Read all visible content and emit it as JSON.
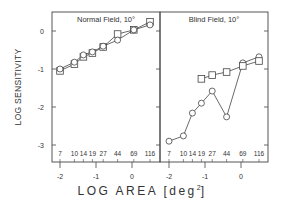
{
  "chart_data": [
    {
      "type": "line",
      "title": "Normal Field, 10°",
      "xlabel": "LOG AREA [deg²]",
      "ylabel": "LOG SENSITIVITY",
      "xlim": [
        -2.2,
        0.75
      ],
      "ylim": [
        -3.4,
        0.5
      ],
      "xticks": [
        -2,
        -1,
        0
      ],
      "yticks": [
        0,
        -1,
        -2,
        -3
      ],
      "area_labels": [
        "7",
        "10",
        "14",
        "19",
        "27",
        "44",
        "69",
        "116"
      ],
      "x": [
        -2.0,
        -1.6,
        -1.35,
        -1.1,
        -0.8,
        -0.4,
        0.05,
        0.5
      ],
      "series": [
        {
          "name": "squares",
          "marker": "square",
          "values": [
            -1.05,
            -0.87,
            -0.68,
            -0.58,
            -0.42,
            -0.08,
            0.03,
            0.24
          ]
        },
        {
          "name": "circles",
          "marker": "circle",
          "values": [
            -1.0,
            -0.82,
            -0.63,
            -0.55,
            -0.4,
            -0.24,
            0.03,
            0.16
          ]
        }
      ],
      "grid": false
    },
    {
      "type": "line",
      "title": "Blind Field, 10°",
      "xlabel": "LOG AREA [deg²]",
      "ylabel": "LOG SENSITIVITY",
      "xlim": [
        -2.2,
        0.75
      ],
      "ylim": [
        -3.4,
        0.5
      ],
      "xticks": [
        -2,
        -1,
        0
      ],
      "yticks": [
        0,
        -1,
        -2,
        -3
      ],
      "area_labels": [
        "7",
        "10",
        "14",
        "19",
        "27",
        "44",
        "69",
        "116"
      ],
      "x": [
        -2.0,
        -1.6,
        -1.35,
        -1.1,
        -0.8,
        -0.4,
        0.05,
        0.5
      ],
      "series": [
        {
          "name": "circles",
          "marker": "circle",
          "values": [
            -2.9,
            -2.76,
            -2.16,
            -1.9,
            -1.58,
            -2.26,
            -0.84,
            -0.68
          ]
        },
        {
          "name": "squares",
          "marker": "square",
          "values": [
            null,
            null,
            null,
            -1.26,
            -1.16,
            -1.08,
            -0.92,
            -0.79
          ]
        }
      ],
      "grid": false
    }
  ],
  "labels": {
    "ylabel": "LOG SENSITIVITY",
    "xlabel_main": "LOG AREA [deg",
    "xlabel_sup": "2",
    "xlabel_end": "]"
  }
}
